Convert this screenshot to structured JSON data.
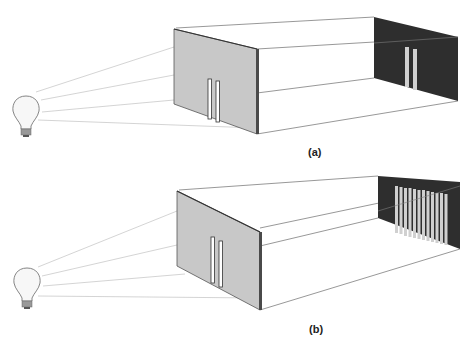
{
  "figure": {
    "panels": [
      {
        "id": "a",
        "label": "(a)",
        "description": "Light bulb illuminating a wall with a double slit; two bright bands appear on the dark screen",
        "slit_count": 2,
        "screen_pattern": "two bands"
      },
      {
        "id": "b",
        "label": "(b)",
        "description": "Light bulb illuminating a wall with a double slit; interference pattern of many bands appears on the dark screen",
        "slit_count": 2,
        "screen_pattern": "interference fringes",
        "fringe_count": 12
      }
    ],
    "colors": {
      "wall": "#c8c8c8",
      "wall_edge": "#555555",
      "screen": "#2e2e2e",
      "band": "#cfcfcf",
      "line": "#8a8a8a",
      "ray": "#c4c4c4"
    }
  }
}
